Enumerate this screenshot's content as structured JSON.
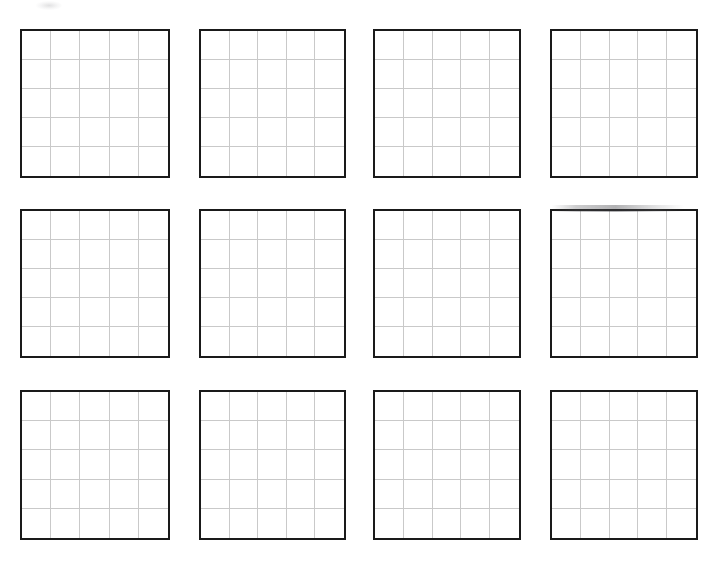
{
  "document": {
    "kind": "worksheet-scan",
    "title": "Blank Grid Worksheet",
    "page_background": "#ffffff",
    "width_px": 718,
    "height_px": 564
  },
  "style": {
    "board_border_color": "#1a1a1a",
    "board_border_width_px": 2.2,
    "gridline_color": "#c9c9c9",
    "gridline_width_px": 1,
    "board_fill": "#ffffff"
  },
  "layout": {
    "rows": 3,
    "columns": 4,
    "total_boards": 12,
    "board_rows": 5,
    "board_columns": 5,
    "cells_per_board": 25
  },
  "artifacts": [
    {
      "name": "scan-smudge",
      "x": 36,
      "y": 1,
      "width": 26,
      "height": 9
    },
    {
      "name": "scan-streak",
      "x": 552,
      "y": 205,
      "width": 132,
      "height": 7
    }
  ],
  "boards": [
    {
      "id": "board-r1c1",
      "label": "",
      "row": 1,
      "column": 1,
      "x": 20,
      "y": 29,
      "width": 150,
      "height": 149,
      "rows": 5,
      "columns": 5,
      "filled": false
    },
    {
      "id": "board-r1c2",
      "label": "",
      "row": 1,
      "column": 2,
      "x": 199,
      "y": 29,
      "width": 147,
      "height": 149,
      "rows": 5,
      "columns": 5,
      "filled": false
    },
    {
      "id": "board-r1c3",
      "label": "",
      "row": 1,
      "column": 3,
      "x": 373,
      "y": 29,
      "width": 148,
      "height": 149,
      "rows": 5,
      "columns": 5,
      "filled": false
    },
    {
      "id": "board-r1c4",
      "label": "",
      "row": 1,
      "column": 4,
      "x": 550,
      "y": 29,
      "width": 148,
      "height": 149,
      "rows": 5,
      "columns": 5,
      "filled": false
    },
    {
      "id": "board-r2c1",
      "label": "",
      "row": 2,
      "column": 1,
      "x": 20,
      "y": 209,
      "width": 150,
      "height": 149,
      "rows": 5,
      "columns": 5,
      "filled": false
    },
    {
      "id": "board-r2c2",
      "label": "",
      "row": 2,
      "column": 2,
      "x": 199,
      "y": 209,
      "width": 147,
      "height": 149,
      "rows": 5,
      "columns": 5,
      "filled": false
    },
    {
      "id": "board-r2c3",
      "label": "",
      "row": 2,
      "column": 3,
      "x": 373,
      "y": 209,
      "width": 148,
      "height": 149,
      "rows": 5,
      "columns": 5,
      "filled": false
    },
    {
      "id": "board-r2c4",
      "label": "",
      "row": 2,
      "column": 4,
      "x": 550,
      "y": 209,
      "width": 148,
      "height": 149,
      "rows": 5,
      "columns": 5,
      "filled": false
    },
    {
      "id": "board-r3c1",
      "label": "",
      "row": 3,
      "column": 1,
      "x": 20,
      "y": 390,
      "width": 150,
      "height": 150,
      "rows": 5,
      "columns": 5,
      "filled": false
    },
    {
      "id": "board-r3c2",
      "label": "",
      "row": 3,
      "column": 2,
      "x": 199,
      "y": 390,
      "width": 147,
      "height": 150,
      "rows": 5,
      "columns": 5,
      "filled": false
    },
    {
      "id": "board-r3c3",
      "label": "",
      "row": 3,
      "column": 3,
      "x": 373,
      "y": 390,
      "width": 148,
      "height": 150,
      "rows": 5,
      "columns": 5,
      "filled": false
    },
    {
      "id": "board-r3c4",
      "label": "",
      "row": 3,
      "column": 4,
      "x": 550,
      "y": 390,
      "width": 148,
      "height": 150,
      "rows": 5,
      "columns": 5,
      "filled": false
    }
  ]
}
